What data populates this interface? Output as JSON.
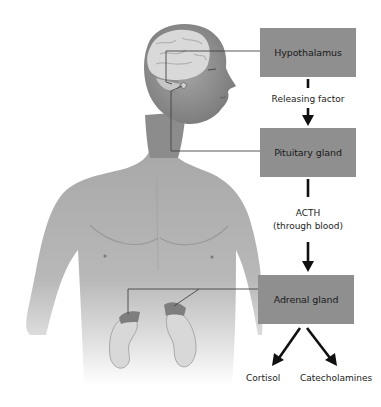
{
  "diagram": {
    "title_visible": false,
    "colors": {
      "box_fill": "#8f8f8f",
      "arrow": "#111111",
      "leader_line": "#444444",
      "skin": "#9a9a9a",
      "brain": "#d9d9d9",
      "kidney": "#d8d8d8"
    },
    "nodes": [
      {
        "id": "hypothalamus",
        "label": "Hypothalamus"
      },
      {
        "id": "pituitary",
        "label": "Pituitary gland"
      },
      {
        "id": "adrenal",
        "label": "Adrenal gland"
      }
    ],
    "edges": [
      {
        "from": "hypothalamus",
        "to": "pituitary",
        "label": "Releasing factor"
      },
      {
        "from": "pituitary",
        "to": "adrenal",
        "label_line1": "ACTH",
        "label_line2": "(through blood)"
      },
      {
        "from": "adrenal",
        "to": "cortisol"
      },
      {
        "from": "adrenal",
        "to": "catecholamines"
      }
    ],
    "outputs": [
      {
        "id": "cortisol",
        "label": "Cortisol"
      },
      {
        "id": "catecholamines",
        "label": "Catecholamines"
      }
    ],
    "illustration": {
      "subject": "male torso with head showing brain, pituitary and kidneys with adrenal glands",
      "callouts": [
        "hypothalamus-in-brain",
        "pituitary-in-brain",
        "adrenal-glands-on-kidneys"
      ]
    }
  }
}
